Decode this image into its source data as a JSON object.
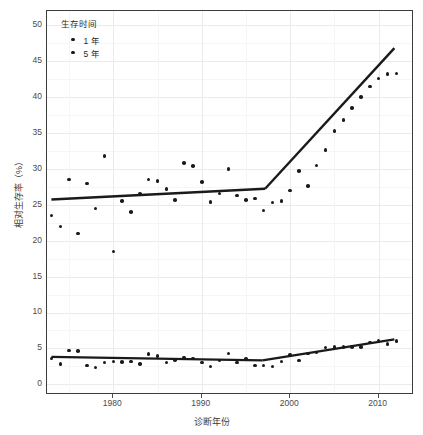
{
  "chart_data": {
    "type": "scatter",
    "title": "",
    "xlabel": "诊断年份",
    "ylabel": "相对生存率（%）",
    "xlim": [
      1972.5,
      2014.0
    ],
    "ylim": [
      -1.5,
      52.0
    ],
    "xticks": [
      1980,
      1990,
      2000,
      2010
    ],
    "yticks": [
      0,
      5,
      10,
      15,
      20,
      25,
      30,
      35,
      40,
      45,
      50
    ],
    "grid": true,
    "legend": {
      "title": "生存时间",
      "position": "top-left-inside",
      "entries": [
        {
          "label": "1 年",
          "marker": "circle",
          "color": "#1a1a1a"
        },
        {
          "label": "5 年",
          "marker": "circle",
          "color": "#1a1a1a"
        }
      ]
    },
    "series": [
      {
        "name": "1 年",
        "marker_color": "#1a1a1a",
        "x": [
          1973,
          1974,
          1975,
          1976,
          1977,
          1978,
          1979,
          1980,
          1981,
          1982,
          1983,
          1984,
          1985,
          1986,
          1987,
          1988,
          1989,
          1990,
          1991,
          1992,
          1993,
          1994,
          1995,
          1996,
          1997,
          1998,
          1999,
          2000,
          2001,
          2002,
          2003,
          2004,
          2005,
          2006,
          2007,
          2008,
          2009,
          2010,
          2011,
          2012
        ],
        "values": [
          23.5,
          22.0,
          28.5,
          21.0,
          28.0,
          24.5,
          31.8,
          18.5,
          25.5,
          24.0,
          26.5,
          28.5,
          28.3,
          27.2,
          25.7,
          30.8,
          30.4,
          28.2,
          25.4,
          26.6,
          30.0,
          26.3,
          25.7,
          25.9,
          24.2,
          25.3,
          25.5,
          27.0,
          29.7,
          27.6,
          30.5,
          32.6,
          35.3,
          36.8,
          38.5,
          40.0,
          41.5,
          42.6,
          43.2,
          43.3
        ]
      },
      {
        "name": "5 年",
        "marker_color": "#1a1a1a",
        "x": [
          1973,
          1974,
          1975,
          1976,
          1977,
          1978,
          1979,
          1980,
          1981,
          1982,
          1983,
          1984,
          1985,
          1986,
          1987,
          1988,
          1989,
          1990,
          1991,
          1992,
          1993,
          1994,
          1995,
          1996,
          1997,
          1998,
          1999,
          2000,
          2001,
          2002,
          2003,
          2004,
          2005,
          2006,
          2007,
          2008,
          2009,
          2010,
          2011,
          2012
        ],
        "values": [
          3.6,
          2.8,
          4.7,
          4.6,
          2.6,
          2.3,
          3.0,
          3.2,
          3.1,
          3.2,
          2.8,
          4.2,
          3.9,
          3.0,
          3.4,
          3.7,
          3.6,
          3.0,
          2.5,
          3.3,
          4.3,
          3.0,
          3.5,
          2.6,
          2.6,
          2.5,
          3.2,
          4.1,
          3.3,
          4.3,
          4.4,
          5.1,
          5.2,
          5.2,
          5.2,
          5.2,
          5.8,
          6.0,
          5.6,
          6.0
        ]
      }
    ],
    "trend_lines": [
      {
        "name": "1 年 joinpoint",
        "color": "#1a1a1a",
        "segments": [
          {
            "x1": 1973.0,
            "y1": 25.6,
            "x2": 1997.3,
            "y2": 27.1
          },
          {
            "x1": 1997.3,
            "y1": 27.1,
            "x2": 2012.0,
            "y2": 46.8
          }
        ]
      },
      {
        "name": "5 年 joinpoint",
        "color": "#1a1a1a",
        "segments": [
          {
            "x1": 1973.0,
            "y1": 3.55,
            "x2": 1997.0,
            "y2": 3.05
          },
          {
            "x1": 1997.0,
            "y1": 3.05,
            "x2": 2012.0,
            "y2": 6.0
          }
        ]
      }
    ]
  }
}
